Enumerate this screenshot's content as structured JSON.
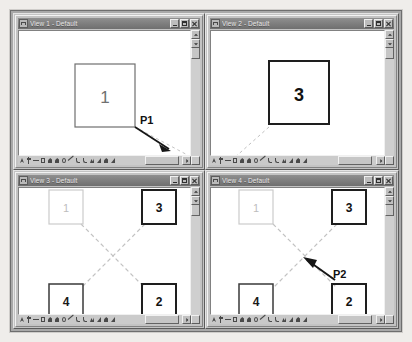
{
  "app": {
    "background_color": "#efedea",
    "frame_color": "#a8a8a8"
  },
  "windows": [
    {
      "id": "view-1",
      "title": "View 1 - Default",
      "icon": "view-window-icon",
      "controls": {
        "minimize": "Minimize",
        "maximize": "Maximize",
        "close": "Close"
      },
      "shapes": [
        {
          "label": "1",
          "style": "medium"
        }
      ],
      "annotations": [
        {
          "label": "P1"
        }
      ],
      "scroll": {
        "vertical_thumb_pct": 45,
        "horizontal_thumb_pct": 62
      }
    },
    {
      "id": "view-2",
      "title": "View 2 - Default",
      "icon": "view-window-icon",
      "controls": {
        "minimize": "Minimize",
        "maximize": "Maximize",
        "close": "Close"
      },
      "shapes": [
        {
          "label": "3",
          "style": "bold"
        }
      ],
      "annotations": [],
      "scroll": {
        "vertical_thumb_pct": 45,
        "horizontal_thumb_pct": 62
      }
    },
    {
      "id": "view-3",
      "title": "View 3 - Default",
      "icon": "view-window-icon",
      "controls": {
        "minimize": "Minimize",
        "maximize": "Maximize",
        "close": "Close"
      },
      "shapes": [
        {
          "label": "1",
          "style": "faint"
        },
        {
          "label": "3",
          "style": "bold"
        },
        {
          "label": "4",
          "style": "medium"
        },
        {
          "label": "2",
          "style": "bold"
        }
      ],
      "annotations": [],
      "scroll": {
        "vertical_thumb_pct": 45,
        "horizontal_thumb_pct": 62
      }
    },
    {
      "id": "view-4",
      "title": "View 4 - Default",
      "icon": "view-window-icon",
      "controls": {
        "minimize": "Minimize",
        "maximize": "Maximize",
        "close": "Close"
      },
      "shapes": [
        {
          "label": "1",
          "style": "faint"
        },
        {
          "label": "3",
          "style": "bold"
        },
        {
          "label": "4",
          "style": "medium"
        },
        {
          "label": "2",
          "style": "bold"
        }
      ],
      "annotations": [
        {
          "label": "P2"
        }
      ],
      "scroll": {
        "vertical_thumb_pct": 45,
        "horizontal_thumb_pct": 62
      }
    }
  ],
  "toolbar": {
    "tools": [
      {
        "name": "select-arrow-tool",
        "glyph": "t-arrow"
      },
      {
        "name": "add-point-tool",
        "glyph": "t-plus"
      },
      {
        "name": "remove-point-tool",
        "glyph": "t-minus"
      },
      {
        "name": "rectangle-tool",
        "glyph": "t-rect"
      },
      {
        "name": "fill-region-tool",
        "glyph": "t-fill"
      },
      {
        "name": "shade-tool",
        "glyph": "t-fill"
      },
      {
        "name": "circle-tool",
        "glyph": "t-circ"
      },
      {
        "name": "line-tool",
        "glyph": "t-line"
      },
      {
        "name": "curve-tool",
        "glyph": "t-curve"
      },
      {
        "name": "arc-tool",
        "glyph": "t-curve"
      },
      {
        "name": "polyline-tool",
        "glyph": "t-poly"
      },
      {
        "name": "triangle-tool",
        "glyph": "t-tri"
      },
      {
        "name": "gradient-tool",
        "glyph": "t-fill"
      },
      {
        "name": "measure-tool",
        "glyph": "t-tri"
      }
    ]
  },
  "colors": {
    "titlebar": "#7d7d7d",
    "titlebar_text": "#e8e8e8",
    "canvas": "#ffffff",
    "shape_bold": "#1a1a1a",
    "shape_medium": "#5a5a5a",
    "shape_faint": "#c8c8c8",
    "dashed_line": "#b9b9b9",
    "arrow": "#1a1a1a",
    "chrome": "#c3c3c3"
  }
}
